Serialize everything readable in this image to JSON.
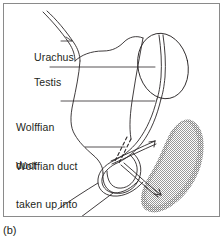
{
  "figure": {
    "caption": "(b)",
    "panel_border_color": "#8a8a8a",
    "background_color": "#ffffff",
    "ink_color": "#231f20",
    "stipple_color": "#808080"
  },
  "labels": {
    "urachus": "Urachus",
    "testis": "Testis",
    "wolffian_duct_line1": "Wolffian",
    "wolffian_duct_line2": "duct",
    "wolffian_trigone_line1": "Wolffian duct",
    "wolffian_trigone_line2": "taken up into",
    "wolffian_trigone_line3": "trigone"
  },
  "structures": {
    "urachus": "urachus-duct",
    "bladder": "bladder-outline",
    "testis": "testis-oval",
    "wolffian_duct": "wolffian-duct-curve",
    "trigone_dashed": "wolffian-duct-dashed-segment",
    "ureter": "ureter-double-line",
    "kidney": "stippled-kidney-mass"
  }
}
